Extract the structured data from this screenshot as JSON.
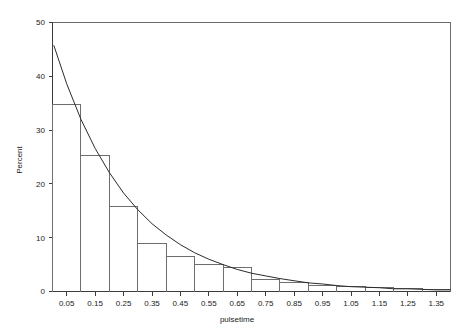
{
  "chart_data": {
    "type": "bar",
    "title": "",
    "xlabel": "pulsetime",
    "ylabel": "Percent",
    "categories": [
      "0.05",
      "0.15",
      "0.25",
      "0.35",
      "0.45",
      "0.55",
      "0.65",
      "0.75",
      "0.85",
      "0.95",
      "1.05",
      "1.15",
      "1.25",
      "1.35"
    ],
    "values": [
      34.8,
      25.2,
      15.8,
      9.0,
      6.6,
      5.1,
      4.4,
      2.2,
      1.6,
      1.2,
      0.9,
      0.7,
      0.5,
      0.4
    ],
    "bin_width": 0.1,
    "xlim": [
      0.0,
      1.4
    ],
    "ylim": [
      0,
      50
    ],
    "xticks": [
      "0.05",
      "0.15",
      "0.25",
      "0.35",
      "0.45",
      "0.55",
      "0.65",
      "0.75",
      "0.85",
      "0.95",
      "1.05",
      "1.15",
      "1.25",
      "1.35"
    ],
    "yticks": [
      "0",
      "10",
      "20",
      "30",
      "40",
      "50"
    ],
    "grid": false,
    "legend": "none",
    "series": [
      {
        "name": "histogram",
        "type": "bar",
        "values": [
          34.8,
          25.2,
          15.8,
          9.0,
          6.6,
          5.1,
          4.4,
          2.2,
          1.6,
          1.2,
          0.9,
          0.7,
          0.5,
          0.4
        ]
      },
      {
        "name": "exponential-fit",
        "type": "line",
        "x": [
          0.005,
          0.05,
          0.1,
          0.15,
          0.2,
          0.25,
          0.3,
          0.35,
          0.4,
          0.45,
          0.5,
          0.55,
          0.6,
          0.65,
          0.7,
          0.75,
          0.8,
          0.85,
          0.9,
          0.95,
          1.0,
          1.05,
          1.1,
          1.15,
          1.2,
          1.25,
          1.3,
          1.35,
          1.4
        ],
        "values": [
          45.7,
          38.6,
          32.0,
          26.6,
          22.1,
          18.3,
          15.2,
          12.6,
          10.5,
          8.7,
          7.2,
          6.0,
          5.0,
          4.1,
          3.4,
          2.9,
          2.4,
          2.0,
          1.6,
          1.4,
          1.1,
          0.9,
          0.8,
          0.7,
          0.5,
          0.5,
          0.4,
          0.3,
          0.3
        ]
      }
    ],
    "colors": {
      "bar_stroke": "#6e6e6e",
      "curve": "#2b2b2b",
      "axis": "#3c3c3c",
      "frame": "#6b6b6b",
      "background": "#ffffff"
    }
  }
}
